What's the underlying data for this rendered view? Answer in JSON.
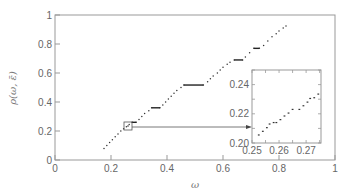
{
  "chart_data": {
    "type": "scatter",
    "title": "",
    "xlabel": "ω",
    "ylabel": "ρ(ω, ε̄)",
    "xlim": [
      0,
      1
    ],
    "ylim": [
      0,
      1
    ],
    "xticks": [
      "0",
      "0.2",
      "0.4",
      "0.6",
      "0.8",
      "1"
    ],
    "yticks": [
      "0",
      "0.2",
      "0.4",
      "0.6",
      "0.8",
      "1"
    ],
    "grid": false,
    "legend": null,
    "series": [
      {
        "name": "rotation number",
        "description": "Devil's-staircase-like increasing dotted curve with flat plateaus",
        "points": [
          [
            0.175,
            0.08
          ],
          [
            0.185,
            0.1
          ],
          [
            0.195,
            0.12
          ],
          [
            0.205,
            0.14
          ],
          [
            0.215,
            0.16
          ],
          [
            0.225,
            0.18
          ],
          [
            0.235,
            0.2
          ],
          [
            0.245,
            0.215
          ],
          [
            0.255,
            0.23
          ],
          [
            0.265,
            0.245
          ],
          [
            0.275,
            0.26
          ],
          [
            0.29,
            0.26
          ],
          [
            0.3,
            0.28
          ],
          [
            0.31,
            0.3
          ],
          [
            0.32,
            0.32
          ],
          [
            0.335,
            0.34
          ],
          [
            0.345,
            0.36
          ],
          [
            0.375,
            0.36
          ],
          [
            0.385,
            0.38
          ],
          [
            0.395,
            0.4
          ],
          [
            0.405,
            0.42
          ],
          [
            0.415,
            0.44
          ],
          [
            0.425,
            0.46
          ],
          [
            0.435,
            0.48
          ],
          [
            0.45,
            0.5
          ],
          [
            0.46,
            0.517
          ],
          [
            0.53,
            0.517
          ],
          [
            0.545,
            0.54
          ],
          [
            0.555,
            0.56
          ],
          [
            0.565,
            0.58
          ],
          [
            0.58,
            0.6
          ],
          [
            0.59,
            0.62
          ],
          [
            0.6,
            0.64
          ],
          [
            0.615,
            0.66
          ],
          [
            0.625,
            0.675
          ],
          [
            0.64,
            0.69
          ],
          [
            0.67,
            0.69
          ],
          [
            0.68,
            0.71
          ],
          [
            0.695,
            0.74
          ],
          [
            0.71,
            0.77
          ],
          [
            0.73,
            0.77
          ],
          [
            0.745,
            0.79
          ],
          [
            0.76,
            0.82
          ],
          [
            0.775,
            0.85
          ],
          [
            0.79,
            0.87
          ],
          [
            0.8,
            0.89
          ],
          [
            0.815,
            0.91
          ],
          [
            0.825,
            0.925
          ]
        ],
        "plateaus": [
          {
            "omega_range": [
              0.275,
              0.29
            ],
            "rho": 0.26
          },
          {
            "omega_range": [
              0.345,
              0.375
            ],
            "rho": 0.36
          },
          {
            "omega_range": [
              0.46,
              0.53
            ],
            "rho": 0.517
          },
          {
            "omega_range": [
              0.64,
              0.67
            ],
            "rho": 0.69
          },
          {
            "omega_range": [
              0.71,
              0.73
            ],
            "rho": 0.77
          }
        ]
      }
    ],
    "annotations": [
      {
        "type": "zoom-box",
        "center": [
          0.255,
          0.228
        ],
        "label": "inset source region"
      },
      {
        "type": "arrow",
        "from": [
          0.27,
          0.227
        ],
        "to": "inset",
        "label": ""
      }
    ],
    "inset": {
      "xlim": [
        0.25,
        0.2755
      ],
      "ylim": [
        0.2,
        0.25
      ],
      "xticks": [
        "0.25",
        "0.26",
        "0.27"
      ],
      "yticks": [
        "0.20",
        "0.22",
        "0.24"
      ],
      "points": [
        [
          0.2525,
          0.2055
        ],
        [
          0.254,
          0.208
        ],
        [
          0.2555,
          0.2105
        ],
        [
          0.2565,
          0.213
        ],
        [
          0.258,
          0.214
        ],
        [
          0.259,
          0.214
        ],
        [
          0.2605,
          0.216
        ],
        [
          0.262,
          0.2185
        ],
        [
          0.2635,
          0.2205
        ],
        [
          0.265,
          0.223
        ],
        [
          0.2675,
          0.223
        ],
        [
          0.269,
          0.2255
        ],
        [
          0.2705,
          0.228
        ],
        [
          0.2715,
          0.2305
        ],
        [
          0.273,
          0.231
        ],
        [
          0.2745,
          0.2335
        ],
        [
          0.276,
          0.236
        ],
        [
          0.277,
          0.2385
        ],
        [
          0.2785,
          0.241
        ],
        [
          0.2795,
          0.2425
        ]
      ]
    }
  }
}
